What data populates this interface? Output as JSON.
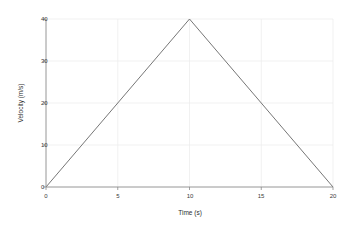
{
  "chart_data": {
    "type": "line",
    "title": "",
    "xlabel": "Time (s)",
    "ylabel": "Velocity (m/s)",
    "x": [
      0,
      10,
      20
    ],
    "values": [
      0,
      40,
      0
    ],
    "series": [
      {
        "name": "Velocity",
        "x": [
          0,
          10,
          20
        ],
        "values": [
          0,
          40,
          0
        ]
      }
    ],
    "xlim": [
      0,
      20
    ],
    "ylim": [
      0,
      40
    ],
    "xticks": [
      0,
      5,
      10,
      15,
      20
    ],
    "yticks": [
      0,
      10,
      20,
      30,
      40
    ],
    "xtick_labels": [
      "0",
      "5",
      "10",
      "15",
      "20"
    ],
    "ytick_labels": [
      "0",
      "10",
      "20",
      "30",
      "40"
    ],
    "grid": true,
    "legend": false,
    "legend_position": "none",
    "annotations": [],
    "colors": {
      "background": "#ffffff",
      "line": "#666666",
      "grid": "#e8e8e8",
      "spine": "#8a8a8a",
      "text": "#3a3a3a"
    }
  }
}
